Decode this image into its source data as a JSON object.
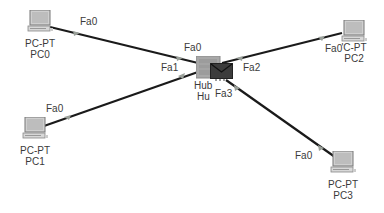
{
  "topology": {
    "colors": {
      "link": "#1a1a1a",
      "link_indicator": "#9aa09a",
      "label": "#3a3a3a",
      "hub_body": "#9a9a9a",
      "envelope": "#3c3c3c"
    },
    "hub": {
      "model": "Hub",
      "name": "Hu",
      "ports": [
        "Fa0",
        "Fa1",
        "Fa2",
        "Fa3"
      ],
      "has_pdu_envelope": true
    },
    "pcs": [
      {
        "model": "PC-PT",
        "name": "PC0",
        "port": "Fa0",
        "hub_port": "Fa0"
      },
      {
        "model": "PC-PT",
        "name": "PC1",
        "port": "Fa0",
        "hub_port": "Fa1"
      },
      {
        "model": "'C-PT",
        "name": "PC2",
        "port": "Fa0",
        "hub_port": "Fa2"
      },
      {
        "model": "PC-PT",
        "name": "PC3",
        "port": "Fa0",
        "hub_port": "Fa3"
      }
    ]
  }
}
